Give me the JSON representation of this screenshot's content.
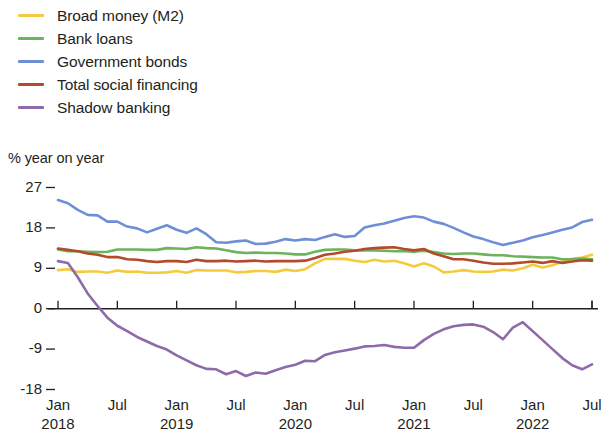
{
  "chart_data": {
    "type": "line",
    "title": "",
    "subtitle": "",
    "ylabel": "% year on year",
    "xlabel": "",
    "ylim": [
      -18,
      27
    ],
    "yticks": [
      27,
      18,
      9,
      0,
      -9,
      -18
    ],
    "ytick_labels": [
      "27",
      "18",
      "9",
      "0",
      "-9",
      "-18"
    ],
    "grid": false,
    "zero_line": true,
    "legend_position": "above-plot-left",
    "x_start": "Jan 2018",
    "x_end": "Jul 2022",
    "x_tick_labels": [
      {
        "month": "Jan",
        "year": "2018"
      },
      {
        "month": "Jul",
        "year": ""
      },
      {
        "month": "Jan",
        "year": "2019"
      },
      {
        "month": "Jul",
        "year": ""
      },
      {
        "month": "Jan",
        "year": "2020"
      },
      {
        "month": "Jul",
        "year": ""
      },
      {
        "month": "Jan",
        "year": "2021"
      },
      {
        "month": "Jul",
        "year": ""
      },
      {
        "month": "Jan",
        "year": "2022"
      },
      {
        "month": "Jul",
        "year": ""
      }
    ],
    "x": [
      "2018-01",
      "2018-02",
      "2018-03",
      "2018-04",
      "2018-05",
      "2018-06",
      "2018-07",
      "2018-08",
      "2018-09",
      "2018-10",
      "2018-11",
      "2018-12",
      "2019-01",
      "2019-02",
      "2019-03",
      "2019-04",
      "2019-05",
      "2019-06",
      "2019-07",
      "2019-08",
      "2019-09",
      "2019-10",
      "2019-11",
      "2019-12",
      "2020-01",
      "2020-02",
      "2020-03",
      "2020-04",
      "2020-05",
      "2020-06",
      "2020-07",
      "2020-08",
      "2020-09",
      "2020-10",
      "2020-11",
      "2020-12",
      "2021-01",
      "2021-02",
      "2021-03",
      "2021-04",
      "2021-05",
      "2021-06",
      "2021-07",
      "2021-08",
      "2021-09",
      "2021-10",
      "2021-11",
      "2021-12",
      "2022-01",
      "2022-02",
      "2022-03",
      "2022-04",
      "2022-05",
      "2022-06",
      "2022-07"
    ],
    "series": [
      {
        "name": "Broad money (M2)",
        "color": "#f4cb3c",
        "values": [
          8.6,
          8.8,
          8.2,
          8.3,
          8.3,
          8.0,
          8.5,
          8.2,
          8.3,
          8.0,
          8.0,
          8.1,
          8.4,
          8.0,
          8.6,
          8.5,
          8.5,
          8.5,
          8.1,
          8.2,
          8.4,
          8.4,
          8.2,
          8.7,
          8.4,
          8.8,
          10.1,
          11.1,
          11.1,
          11.1,
          10.7,
          10.4,
          10.9,
          10.5,
          10.7,
          10.1,
          9.4,
          10.1,
          9.4,
          8.1,
          8.3,
          8.6,
          8.3,
          8.2,
          8.3,
          8.7,
          8.5,
          9.0,
          9.8,
          9.2,
          9.7,
          10.5,
          11.1,
          11.4,
          12.0
        ]
      },
      {
        "name": "Bank loans",
        "color": "#6cb35e",
        "values": [
          13.2,
          12.8,
          12.8,
          12.7,
          12.6,
          12.7,
          13.2,
          13.2,
          13.2,
          13.1,
          13.1,
          13.5,
          13.4,
          13.3,
          13.7,
          13.5,
          13.4,
          13.0,
          12.6,
          12.4,
          12.5,
          12.4,
          12.4,
          12.3,
          12.1,
          12.1,
          12.7,
          13.1,
          13.2,
          13.2,
          13.0,
          13.0,
          13.0,
          12.9,
          12.8,
          12.8,
          12.7,
          12.9,
          12.6,
          12.3,
          12.2,
          12.3,
          12.3,
          12.1,
          11.9,
          11.9,
          11.7,
          11.6,
          11.5,
          11.4,
          11.4,
          11.0,
          11.0,
          11.2,
          11.0
        ]
      },
      {
        "name": "Government bonds",
        "color": "#6e8fd7",
        "values": [
          24.2,
          23.5,
          22.0,
          20.9,
          20.8,
          19.4,
          19.4,
          18.3,
          17.9,
          17.0,
          17.8,
          18.6,
          17.6,
          16.9,
          17.9,
          16.6,
          14.8,
          14.7,
          15.0,
          15.2,
          14.4,
          14.5,
          14.9,
          15.5,
          15.2,
          15.5,
          15.3,
          16.0,
          16.6,
          16.0,
          16.2,
          18.1,
          18.6,
          19.0,
          19.6,
          20.2,
          20.6,
          20.3,
          19.4,
          18.9,
          18.0,
          17.0,
          16.1,
          15.5,
          14.8,
          14.2,
          14.7,
          15.2,
          15.9,
          16.4,
          17.0,
          17.6,
          18.1,
          19.3,
          19.8
        ]
      },
      {
        "name": "Total social financing",
        "color": "#b24a2b",
        "values": [
          13.4,
          13.1,
          12.8,
          12.3,
          12.0,
          11.5,
          11.5,
          11.0,
          10.9,
          10.6,
          10.4,
          10.6,
          10.6,
          10.4,
          10.9,
          10.6,
          10.6,
          10.7,
          10.5,
          10.6,
          10.7,
          10.5,
          10.6,
          10.6,
          10.6,
          10.7,
          11.3,
          12.0,
          12.3,
          12.7,
          12.9,
          13.3,
          13.5,
          13.6,
          13.7,
          13.3,
          13.0,
          13.3,
          12.3,
          11.7,
          11.0,
          11.0,
          10.7,
          10.3,
          10.0,
          10.0,
          10.1,
          10.3,
          10.5,
          10.2,
          10.6,
          10.2,
          10.5,
          10.8,
          10.7
        ]
      },
      {
        "name": "Shadow banking",
        "color": "#8d6bab",
        "values": [
          10.6,
          10.2,
          7.0,
          3.4,
          0.6,
          -2.0,
          -3.8,
          -5.0,
          -6.3,
          -7.3,
          -8.3,
          -9.1,
          -10.4,
          -11.5,
          -12.6,
          -13.4,
          -13.5,
          -14.6,
          -13.9,
          -15.0,
          -14.2,
          -14.5,
          -13.7,
          -13.0,
          -12.5,
          -11.6,
          -11.7,
          -10.3,
          -9.7,
          -9.3,
          -8.9,
          -8.4,
          -8.3,
          -8.1,
          -8.5,
          -8.7,
          -8.7,
          -7.0,
          -5.6,
          -4.6,
          -3.9,
          -3.6,
          -3.5,
          -4.0,
          -5.2,
          -6.8,
          -4.2,
          -3.0,
          -5.0,
          -7.0,
          -9.0,
          -11.0,
          -12.6,
          -13.5,
          -12.4
        ]
      }
    ]
  }
}
